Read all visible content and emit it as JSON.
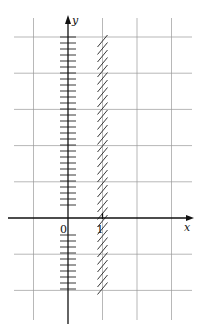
{
  "figure": {
    "axes": {
      "x_label": "x",
      "y_label": "y",
      "origin_label": "0",
      "x_tick_labels": [
        "1"
      ]
    },
    "grid": {
      "x_range": [
        -1,
        3
      ],
      "y_range": [
        -3,
        5
      ],
      "step": 1
    },
    "marked_lines": [
      {
        "name": "y-axis",
        "equation": "x = 0",
        "style": "horizontal-ticks",
        "y_range": [
          -2,
          5
        ]
      },
      {
        "name": "line-x-equals-1",
        "equation": "x = 1",
        "style": "diagonal-hatch",
        "y_range": [
          -2,
          5
        ]
      }
    ],
    "colors": {
      "grid": "#9a9a9a",
      "ink": "#111111",
      "background": "#ffffff"
    }
  }
}
